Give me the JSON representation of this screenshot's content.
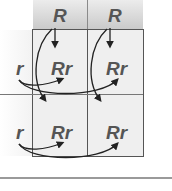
{
  "diagram": {
    "type": "punnett-square",
    "column_headers": [
      "R",
      "R"
    ],
    "row_headers": [
      "r",
      "r"
    ],
    "cells": [
      [
        "Rr",
        "Rr"
      ],
      [
        "Rr",
        "Rr"
      ]
    ]
  },
  "colors": {
    "text": "#555555",
    "grid_line": "#555555",
    "header_bg": "#c9c9c9",
    "cell_bg": "#efefef",
    "arrow": "#222222"
  }
}
